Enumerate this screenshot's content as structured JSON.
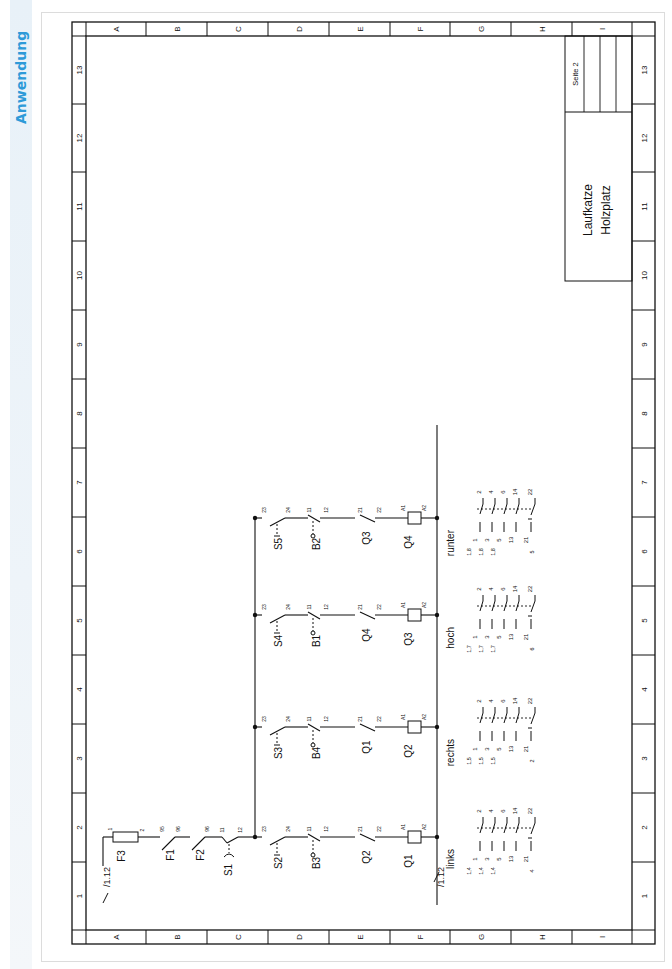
{
  "sidebar": {
    "label": "Anwendung",
    "color": "#2d9ad8"
  },
  "frame": {
    "rows": [
      "A",
      "B",
      "C",
      "D",
      "E",
      "F",
      "G",
      "H",
      "I"
    ],
    "columns": [
      "1",
      "2",
      "3",
      "4",
      "5",
      "6",
      "7",
      "8",
      "9",
      "10",
      "11",
      "12",
      "13"
    ]
  },
  "title_block": {
    "title_line1": "Laufkatze",
    "title_line2": "Holzplatz",
    "page": "Seite 2"
  },
  "supply": {
    "cross_ref_in": "/1.12",
    "cross_ref_out": "/1.12",
    "fuse": {
      "name": "F3",
      "t1": "1",
      "t2": "2"
    },
    "f1": {
      "name": "F1",
      "t1": "95",
      "t2": "96"
    },
    "f2": {
      "name": "F2",
      "t1": "95",
      "t2": "96"
    },
    "s1": {
      "name": "S1",
      "t1": "11",
      "t2": "12"
    }
  },
  "branches": [
    {
      "button": "S2",
      "b_t1": "23",
      "b_t2": "24",
      "limit": "B3",
      "l_t1": "11",
      "l_t2": "12",
      "interlock": "Q2",
      "i_t1": "21",
      "i_t2": "22",
      "coil": "Q1",
      "c_t1": "A1",
      "c_t2": "A2",
      "label": "links",
      "contacts": {
        "top": [
          "2",
          "4",
          "6",
          "14",
          "22"
        ],
        "bottom": [
          "1",
          "3",
          "5",
          "13",
          "21"
        ],
        "refs": [
          "1,4",
          "1,4",
          "1,4"
        ],
        "nc_ref": "4"
      }
    },
    {
      "button": "S3",
      "b_t1": "23",
      "b_t2": "24",
      "limit": "B4",
      "l_t1": "11",
      "l_t2": "12",
      "interlock": "Q1",
      "i_t1": "21",
      "i_t2": "22",
      "coil": "Q2",
      "c_t1": "A1",
      "c_t2": "A2",
      "label": "rechts",
      "contacts": {
        "top": [
          "2",
          "4",
          "6",
          "14",
          "22"
        ],
        "bottom": [
          "1",
          "3",
          "5",
          "13",
          "21"
        ],
        "refs": [
          "1,5",
          "1,5",
          "1,5"
        ],
        "nc_ref": "2"
      }
    },
    {
      "button": "S4",
      "b_t1": "23",
      "b_t2": "24",
      "limit": "B1",
      "l_t1": "11",
      "l_t2": "12",
      "interlock": "Q4",
      "i_t1": "21",
      "i_t2": "22",
      "coil": "Q3",
      "c_t1": "A1",
      "c_t2": "A2",
      "label": "hoch",
      "contacts": {
        "top": [
          "2",
          "4",
          "6",
          "14",
          "22"
        ],
        "bottom": [
          "1",
          "3",
          "5",
          "13",
          "21"
        ],
        "refs": [
          "1,7",
          "1,7",
          "1,7"
        ],
        "nc_ref": "6"
      }
    },
    {
      "button": "S5",
      "b_t1": "23",
      "b_t2": "24",
      "limit": "B2",
      "l_t1": "11",
      "l_t2": "12",
      "interlock": "Q3",
      "i_t1": "21",
      "i_t2": "22",
      "coil": "Q4",
      "c_t1": "A1",
      "c_t2": "A2",
      "label": "runter",
      "contacts": {
        "top": [
          "2",
          "4",
          "6",
          "14",
          "22"
        ],
        "bottom": [
          "1",
          "3",
          "5",
          "13",
          "21"
        ],
        "refs": [
          "1,8",
          "1,8",
          "1,8"
        ],
        "nc_ref": "5"
      }
    }
  ]
}
